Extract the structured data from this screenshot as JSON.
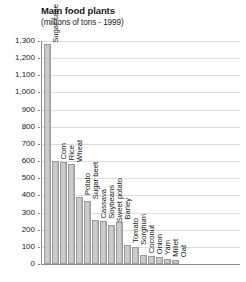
{
  "header": {
    "title": "Main food plants",
    "subtitle": "(millions of tons - 1999)"
  },
  "chart_data": {
    "type": "bar",
    "title": "Main food plants",
    "subtitle": "(millions of tons - 1999)",
    "xlabel": "",
    "ylabel": "",
    "ylim": [
      0,
      1300
    ],
    "ytick_step": 100,
    "grid": true,
    "legend": "none",
    "orientation": "vertical",
    "bar_label_rotation": -90,
    "units": "millions of tons",
    "year": 1999,
    "yticks": [
      "0",
      "100",
      "200",
      "300",
      "400",
      "500",
      "600",
      "700",
      "800",
      "900",
      "1,000",
      "1,100",
      "1,200",
      "1,300"
    ],
    "categories": [
      "Sugar cane",
      "Corn",
      "Rice",
      "Wheat",
      "Potato",
      "Sugar beet",
      "Cassava",
      "Soybeans",
      "Sweet potato",
      "Barley",
      "Tomato",
      "Sorghum",
      "Coconut",
      "Onion",
      "Yam",
      "Millet",
      "Oat"
    ],
    "values": [
      1280,
      600,
      595,
      585,
      390,
      365,
      255,
      250,
      230,
      245,
      110,
      100,
      50,
      45,
      38,
      30,
      26
    ]
  },
  "colors": {
    "bar_fill": "#c9c9c9",
    "bar_edge": "#9c9c9c",
    "gridline": "#dedede",
    "axis": "#8a8a8a",
    "text": "#1a1a1a",
    "background": "#ffffff"
  }
}
